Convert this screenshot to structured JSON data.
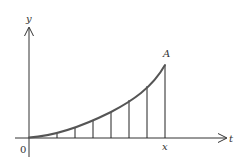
{
  "diagram": {
    "type": "area-under-curve",
    "labels": {
      "y_axis": "y",
      "t_axis": "t",
      "origin": "0",
      "x_mark": "x",
      "point": "A"
    },
    "colors": {
      "axis": "#333333",
      "curve": "#555555",
      "ordinate": "#222222",
      "background": "#ffffff"
    },
    "ordinates_x_px": [
      57,
      75,
      93,
      111,
      129,
      147,
      165
    ],
    "curve_points_px": [
      [
        29,
        137
      ],
      [
        43,
        136.5
      ],
      [
        57,
        134
      ],
      [
        75,
        128
      ],
      [
        93,
        121
      ],
      [
        111,
        112
      ],
      [
        129,
        100
      ],
      [
        147,
        86
      ],
      [
        165,
        66
      ]
    ]
  }
}
